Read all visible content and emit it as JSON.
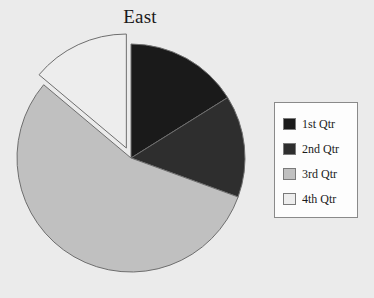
{
  "chart_data": {
    "type": "pie",
    "title": "East",
    "xlabel": "",
    "ylabel": "",
    "categories": [
      "1st Qtr",
      "2nd Qtr",
      "3rd Qtr",
      "4th Qtr"
    ],
    "values": [
      16,
      15,
      55,
      14
    ],
    "units": "percent",
    "colors": [
      "#1a1a1a",
      "#2e2e2e",
      "#c0c0c0",
      "#ededed"
    ],
    "start_angle_deg": 0,
    "direction": "clockwise",
    "exploded_slices": [
      "4th Qtr"
    ],
    "explode_offset_px": 11,
    "slice_angles_deg": [
      {
        "name": "1st Qtr",
        "start": 0,
        "end": 58
      },
      {
        "name": "2nd Qtr",
        "start": 58,
        "end": 110
      },
      {
        "name": "3rd Qtr",
        "start": 110,
        "end": 310
      },
      {
        "name": "4th Qtr",
        "start": 310,
        "end": 360
      }
    ],
    "legend": {
      "position": "right",
      "entries": [
        "1st Qtr",
        "2nd Qtr",
        "3rd Qtr",
        "4th Qtr"
      ]
    },
    "grid": false,
    "background_color": "#ebebeb",
    "plot_border": false
  },
  "legend": {
    "items": [
      {
        "label": "1st Qtr",
        "color": "#1a1a1a"
      },
      {
        "label": "2nd Qtr",
        "color": "#2e2e2e"
      },
      {
        "label": "3rd Qtr",
        "color": "#c0c0c0"
      },
      {
        "label": "4th Qtr",
        "color": "#ededed"
      }
    ]
  }
}
